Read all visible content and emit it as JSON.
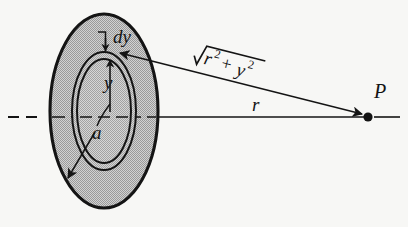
{
  "figure": {
    "kind": "physics-diagram",
    "background_color": "#f7f7f5",
    "ink_color": "#141414",
    "disk_fill_color": "#bdbdbd",
    "ring_fill_color": "#c4c4c4"
  },
  "labels": {
    "dy": "dy",
    "y": "y",
    "a": "a",
    "r": "r",
    "point_p": "P",
    "hypotenuse": {
      "radical_glyph": "√",
      "r_base": "r",
      "r_exponent": "2",
      "plus": "+",
      "y_base": "y",
      "y_exponent": "2",
      "plain_text": "√(r² + y²)"
    }
  },
  "geometry": {
    "disk": {
      "center_x": 104,
      "center_y": 111,
      "radius_x": 54,
      "radius_y": 97
    },
    "ring_outer": {
      "center_x": 104,
      "center_y": 111,
      "radius_x": 32,
      "radius_y": 59
    },
    "ring_inner": {
      "center_x": 104,
      "center_y": 111,
      "radius_x": 27,
      "radius_y": 52
    },
    "point_p": {
      "x": 368,
      "y": 117
    },
    "axis": {
      "y": 117,
      "x_start": 8,
      "x_end": 400
    }
  }
}
